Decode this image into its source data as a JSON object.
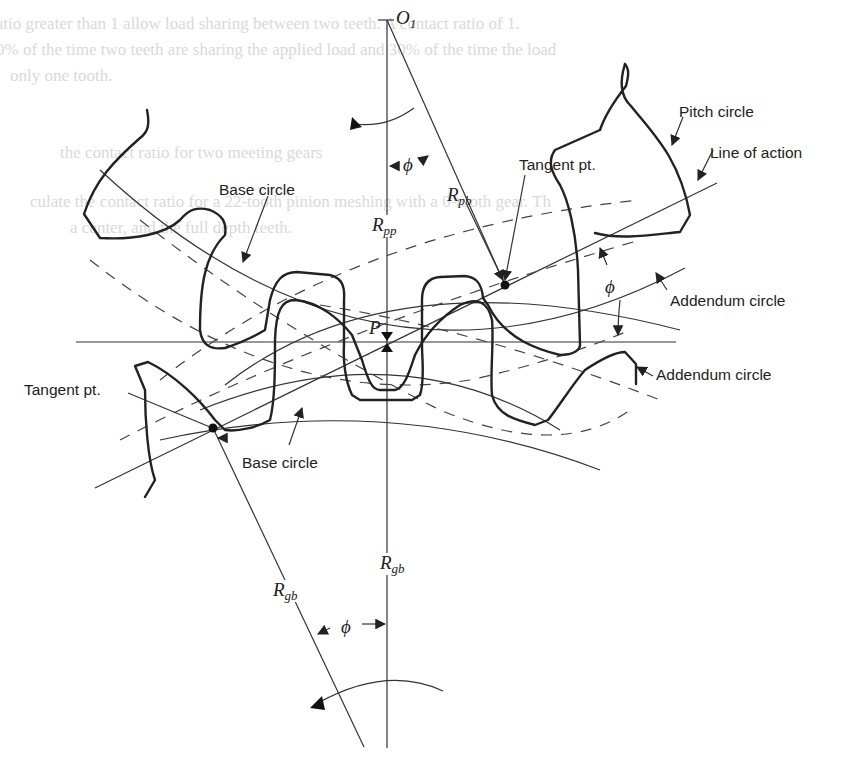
{
  "figure": {
    "type": "involute spur gear meshing diagram",
    "bleed_through_text": [
      "ratio greater than 1 allow load sharing between two teeth. A contact ratio of 1.",
      "0% of the time two teeth are sharing the applied load and 30% of the time the load",
      "only one tooth.",
      "the contact ratio for two meeting gears",
      "culate the contact ratio for a 22-tooth pinion meshing with a 0-tooth gear. Th",
      "a center, and the full depth teeth."
    ],
    "labels": {
      "center_top": "O",
      "center_top_sub": "1",
      "pitch_point": "P",
      "pitch_circle": "Pitch circle",
      "line_of_action": "Line of action",
      "tangent_pt_upper": "Tangent pt.",
      "tangent_pt_lower": "Tangent pt.",
      "base_circle_upper": "Base circle",
      "base_circle_lower": "Base circle",
      "addendum_circle_upper": "Addendum circle",
      "addendum_circle_lower": "Addendum circle",
      "r_pb_main": "R",
      "r_pb_sub": "pb",
      "r_pp_main": "R",
      "r_pp_sub": "pp",
      "r_gb_left_main": "R",
      "r_gb_left_sub": "gb",
      "r_gb_center_main": "R",
      "r_gb_center_sub": "gb",
      "phi_top": "ϕ",
      "phi_right": "ϕ",
      "phi_bottom": "ϕ"
    },
    "colors": {
      "ink": "#222222",
      "background": "#ffffff",
      "bleed": "#d9d9d9"
    }
  }
}
